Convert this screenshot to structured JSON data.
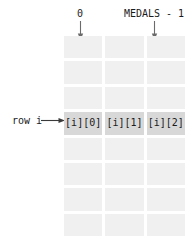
{
  "diagram": {
    "colors": {
      "cell_background": "#f0f0f0",
      "highlight_background": "#d8d8d8",
      "text": "#1b1b1b",
      "arrow": "#6b6b6b",
      "page_background": "#ffffff"
    },
    "column_labels": [
      {
        "text": "0",
        "name": "first-column-label"
      },
      {
        "text": "MEDALS - 1",
        "name": "last-column-label"
      }
    ],
    "row_label": "row i",
    "grid": {
      "rows": 8,
      "columns": 3,
      "highlighted_row_index": 3,
      "highlighted_row_cells": [
        "[i][0]",
        "[i][1]",
        "[i][2]"
      ],
      "empty_cell_text": ""
    }
  }
}
